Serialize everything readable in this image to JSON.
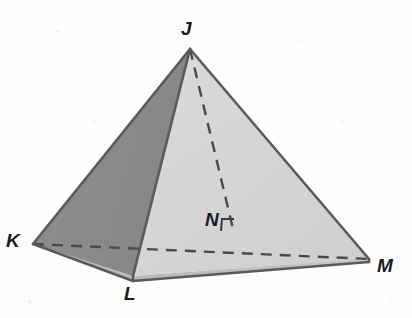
{
  "figure": {
    "name": "rectangular-pyramid-jklm",
    "canvas": {
      "width": 412,
      "height": 318
    },
    "background_color": "#fdfdfd",
    "colors": {
      "shaded_face": "#8b8b8b",
      "light_face": "#d6d6d6",
      "light_face_right": "#d2d2d2",
      "edge_stroke": "#5a5a5a",
      "dashed_stroke": "#4a4a4a",
      "label_color": "#1b1b1b"
    },
    "vertices": [
      {
        "id": "J",
        "label": "J",
        "x": 190,
        "y": 49,
        "label_x": 181,
        "label_y": 19,
        "role": "apex"
      },
      {
        "id": "K",
        "label": "K",
        "x": 33,
        "y": 244,
        "label_x": 6,
        "label_y": 231,
        "role": "base-left"
      },
      {
        "id": "L",
        "label": "L",
        "x": 133,
        "y": 276,
        "label_x": 124,
        "label_y": 284,
        "role": "base-front"
      },
      {
        "id": "M",
        "label": "M",
        "x": 369,
        "y": 259,
        "label_x": 377,
        "label_y": 256,
        "role": "base-right"
      },
      {
        "id": "N",
        "label": "N",
        "x": 234,
        "y": 233,
        "label_x": 205,
        "label_y": 210,
        "role": "altitude-foot"
      }
    ],
    "solid_edges": [
      {
        "name": "edge-JK",
        "from": "J",
        "to": "K"
      },
      {
        "name": "edge-JL",
        "from": "J",
        "to": "L"
      },
      {
        "name": "edge-JM",
        "from": "J",
        "to": "M"
      },
      {
        "name": "edge-KL",
        "from": "K",
        "to": "L"
      },
      {
        "name": "edge-LM",
        "from": "L",
        "to": "M"
      }
    ],
    "dashed_edges": [
      {
        "name": "edge-KM-hidden",
        "from": "K",
        "to": "M"
      },
      {
        "name": "altitude-JN",
        "from": "J",
        "to": "N"
      }
    ],
    "right_angle_marker": {
      "name": "right-angle-at-N",
      "size": 13
    },
    "faces": [
      {
        "name": "face-JKL-shaded",
        "points": "190,49 33,244 133,276",
        "fill": "#8b8b8b"
      },
      {
        "name": "face-JLM-light",
        "points": "190,49 133,276 369,259",
        "fill": "#d4d4d4"
      },
      {
        "name": "face-base-KLM-sliver",
        "points": "33,244 133,276 369,259",
        "fill": "#bdbdbd"
      }
    ],
    "specks": [
      {
        "x": 56,
        "y": 30,
        "w": 3,
        "h": 3
      },
      {
        "x": 300,
        "y": 40,
        "w": 2,
        "h": 2
      },
      {
        "x": 340,
        "y": 120,
        "w": 3,
        "h": 2
      },
      {
        "x": 28,
        "y": 300,
        "w": 3,
        "h": 3
      },
      {
        "x": 390,
        "y": 300,
        "w": 2,
        "h": 2
      },
      {
        "x": 94,
        "y": 120,
        "w": 2,
        "h": 2
      }
    ]
  }
}
